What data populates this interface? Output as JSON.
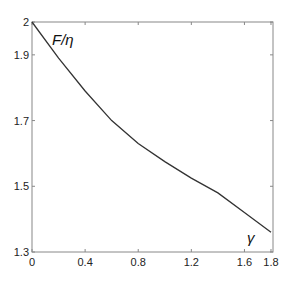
{
  "chart_data": {
    "type": "line",
    "title": "",
    "xlabel": "γ",
    "ylabel": "F/η",
    "xlim": [
      0,
      1.8
    ],
    "ylim": [
      1.3,
      2.0
    ],
    "grid": false,
    "x_ticks": [
      "0",
      "0.4",
      "0.8",
      "1.2",
      "1.6",
      "1.8"
    ],
    "y_ticks": [
      "1.3",
      "1.5",
      "1.7",
      "1.9",
      "2"
    ],
    "series": [
      {
        "name": "F/η",
        "x": [
          0,
          0.2,
          0.4,
          0.6,
          0.8,
          1.0,
          1.2,
          1.4,
          1.6,
          1.8
        ],
        "y": [
          2.0,
          1.89,
          1.79,
          1.7,
          1.63,
          1.575,
          1.525,
          1.48,
          1.42,
          1.36
        ]
      }
    ]
  },
  "labels": {
    "curve_label": "F/η",
    "x_label": "γ"
  }
}
